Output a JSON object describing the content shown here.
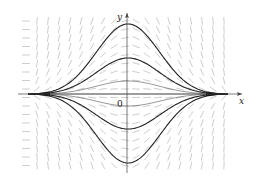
{
  "chart_data": {
    "type": "line",
    "title": "",
    "subtitle": "",
    "xlabel": "x",
    "ylabel": "y",
    "origin_label": "0",
    "grid": false,
    "legend": null,
    "axis_pixel": {
      "origin_x": 127,
      "origin_y": 94,
      "x_min_px": 18,
      "x_max_px": 242,
      "y_top_px": 13,
      "y_bottom_px": 173
    },
    "converge_points_px": [
      [
        28,
        94
      ],
      [
        228,
        94
      ]
    ],
    "x_range": [
      -1,
      1
    ],
    "solution_curves": {
      "shape": "bump: A * exp(-u^2/(2*0.35^2)) * (1 - u^2), u in [-1,1]",
      "amplitudes_px": [
        70,
        36,
        13,
        0,
        -12,
        -35,
        -69
      ],
      "thick_amplitudes_px": [
        70,
        36,
        -35,
        -69
      ],
      "thin_amplitudes_px": [
        13,
        0,
        -12
      ]
    },
    "slope_field": {
      "x_start_px": 26,
      "x_step_px": 11,
      "x_count": 19,
      "y_start_px": 21,
      "y_step_px": 8.5,
      "y_count": 18,
      "segment_length_px": 7,
      "color": "#b8b8b8"
    },
    "colors": {
      "curve": "#222222",
      "thin_curve": "#555555",
      "axis": "#444444",
      "field": "#b8b8b8",
      "background": "#ffffff"
    }
  }
}
